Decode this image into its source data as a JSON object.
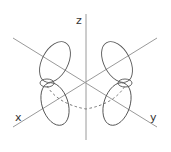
{
  "diagram": {
    "axes": {
      "z": {
        "label": "z"
      },
      "x": {
        "label": "x"
      },
      "y": {
        "label": "y"
      }
    },
    "colors": {
      "axis": "#9a9a9a",
      "lobe": "#555555",
      "label": "#333333"
    },
    "lobes": 4
  }
}
